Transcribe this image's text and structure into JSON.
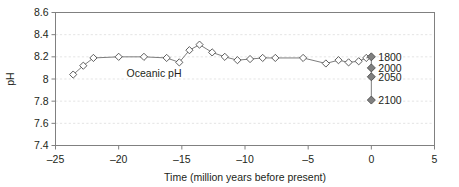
{
  "chart_data": {
    "type": "line",
    "title": "",
    "xlabel": "Time (million years before present)",
    "ylabel": "pH",
    "xlim": [
      -25,
      5
    ],
    "ylim": [
      7.4,
      8.6
    ],
    "grid": true,
    "legend_position": "none",
    "xticks": [
      -25,
      -20,
      -15,
      -10,
      -5,
      0,
      5
    ],
    "xtick_labels": [
      "–25",
      "–20",
      "–15",
      "–10",
      "–5",
      "0",
      "5"
    ],
    "yticks": [
      7.4,
      7.6,
      7.8,
      8.0,
      8.2,
      8.4,
      8.6
    ],
    "ytick_labels": [
      "7.4",
      "7.6",
      "7.8",
      "8",
      "8.2",
      "8.4",
      "8.6"
    ],
    "annotations": [
      {
        "text": "Oceanic pH",
        "x": -17.2,
        "y": 8.02
      }
    ],
    "series": [
      {
        "name": "Oceanic pH",
        "marker": "open-diamond",
        "x": [
          -23.6,
          -22.8,
          -22.0,
          -20.0,
          -18.0,
          -16.2,
          -15.2,
          -14.4,
          -13.6,
          -12.6,
          -11.6,
          -10.6,
          -9.6,
          -8.6,
          -7.6,
          -5.4,
          -3.6,
          -2.6,
          -1.8,
          -1.0,
          -0.4
        ],
        "y": [
          8.04,
          8.12,
          8.19,
          8.2,
          8.2,
          8.19,
          8.15,
          8.26,
          8.31,
          8.24,
          8.2,
          8.17,
          8.18,
          8.19,
          8.19,
          8.19,
          8.14,
          8.17,
          8.15,
          8.16,
          8.19
        ]
      },
      {
        "name": "Future scenarios",
        "marker": "filled-diamond",
        "x": [
          0,
          0,
          0,
          0
        ],
        "y": [
          8.2,
          8.1,
          8.02,
          7.81
        ],
        "point_labels": [
          "1800",
          "2000",
          "2050",
          "2100"
        ]
      }
    ]
  },
  "scenarios": {
    "items": [
      {
        "label": "1800",
        "ph": 8.2
      },
      {
        "label": "2000",
        "ph": 8.1
      },
      {
        "label": "2050",
        "ph": 8.02
      },
      {
        "label": "2100",
        "ph": 7.81
      }
    ]
  },
  "colors": {
    "frame": "#808080",
    "grid": "#d9d9d9",
    "line": "#6e6e6e",
    "marker_fill_open": "#ffffff",
    "marker_fill_closed": "#808080",
    "text": "#231f20",
    "background": "#ffffff"
  }
}
